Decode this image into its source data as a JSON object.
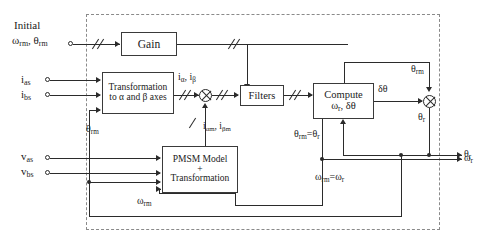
{
  "diagram": {
    "type": "control-block-diagram",
    "colors": {
      "line": "#2b2b2b",
      "enclosure": "#8a8a8a",
      "block_fill": "#ffffff"
    },
    "inputs": [
      {
        "name": "initial-conditions",
        "label_line1": "Initial",
        "label_line2_a": "ω",
        "label_line2_a_sub": "rm",
        "label_line2_sep": ", ",
        "label_line2_b": "θ",
        "label_line2_b_sub": "rm",
        "text": "Initial ωrm, θrm"
      },
      {
        "name": "current-as",
        "base": "i",
        "sub": "as",
        "text": "ias"
      },
      {
        "name": "current-bs",
        "base": "i",
        "sub": "bs",
        "text": "ibs"
      },
      {
        "name": "voltage-as",
        "base": "v",
        "sub": "as",
        "text": "vas"
      },
      {
        "name": "voltage-bs",
        "base": "v",
        "sub": "bs",
        "text": "vbs"
      }
    ],
    "blocks": [
      {
        "name": "gain-block",
        "label": "Gain",
        "lines": [
          "Gain"
        ]
      },
      {
        "name": "transformation-block",
        "lines": [
          "Transformation",
          "to α and β axes"
        ]
      },
      {
        "name": "filters-block",
        "lines": [
          "Filters"
        ]
      },
      {
        "name": "compute-block",
        "line1": "Compute",
        "line2_a": "ω",
        "line2_a_sub": "r",
        "line2_sep": ", ",
        "line2_b": "δθ",
        "lines": [
          "Compute",
          "ωr, δθ"
        ]
      },
      {
        "name": "pmsm-model-block",
        "lines": [
          "PMSM Model",
          "+",
          "Transformation"
        ]
      }
    ],
    "signal_labels": [
      {
        "name": "label-i-alpha-beta",
        "base1": "i",
        "sub1": "α",
        "base2": "i",
        "sub2": "β",
        "text": "iα, iβ"
      },
      {
        "name": "label-i-alpha-m-beta-m",
        "base1": "i",
        "sub1": "αm",
        "base2": "i",
        "sub2": "βm",
        "text": "iαm, iβm"
      },
      {
        "name": "label-theta-rm-left",
        "base": "θ",
        "sub": "rm",
        "text": "θrm"
      },
      {
        "name": "label-omega-rm-feedback",
        "base": "ω",
        "sub": "rm",
        "text": "ωrm"
      },
      {
        "name": "label-delta-theta",
        "text": "δθ"
      },
      {
        "name": "label-theta-rm-top",
        "base": "θ",
        "sub": "rm",
        "text": "θrm"
      },
      {
        "name": "label-theta-r-mult",
        "base": "θ",
        "sub": "r",
        "text": "θr"
      },
      {
        "name": "label-theta-rm-eq-theta-r",
        "base1": "θ",
        "sub1": "rm",
        "eq": "=",
        "base2": "θ",
        "sub2": "r",
        "text": "θrm=θr"
      },
      {
        "name": "label-omega-rm-eq-omega-r",
        "base1": "ω",
        "sub1": "rm",
        "eq": "=",
        "base2": "ω",
        "sub2": "r",
        "text": "ωrm=ωr"
      }
    ],
    "outputs": [
      {
        "name": "output-theta-r",
        "base": "θ",
        "sub": "r",
        "text": "θr"
      },
      {
        "name": "output-omega-r",
        "base": "ω",
        "sub": "r",
        "text": "ωr"
      }
    ]
  }
}
